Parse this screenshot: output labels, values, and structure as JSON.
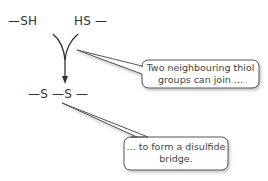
{
  "diagram": {
    "top_left_group": "—SH",
    "top_right_group": "HS —",
    "product": "—S —S —",
    "callouts": [
      {
        "text_line1": "Two neighbouring thiol",
        "text_line2": "groups can join ..."
      },
      {
        "text_line1": "... to form a disulfide",
        "text_line2": "bridge."
      }
    ],
    "colors": {
      "line": "#333333",
      "callout_border": "#555555",
      "callout_shadow": "#bbbbbb"
    }
  }
}
